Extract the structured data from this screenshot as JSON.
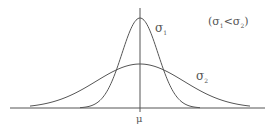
{
  "diagram": {
    "curves": [
      {
        "name": "sigma1",
        "label": "σ",
        "subscript": "1",
        "peak_y": 18,
        "spread": 18
      },
      {
        "name": "sigma2",
        "label": "σ",
        "subscript": "2",
        "peak_y": 64,
        "spread": 44
      }
    ],
    "axis_label": "μ",
    "condition": {
      "open": "(",
      "s1": "σ",
      "sub1": "1",
      "lt": "<",
      "s2": "σ",
      "sub2": "2",
      "close": ")"
    },
    "colors": {
      "line": "#555555",
      "text": "#555555"
    }
  }
}
